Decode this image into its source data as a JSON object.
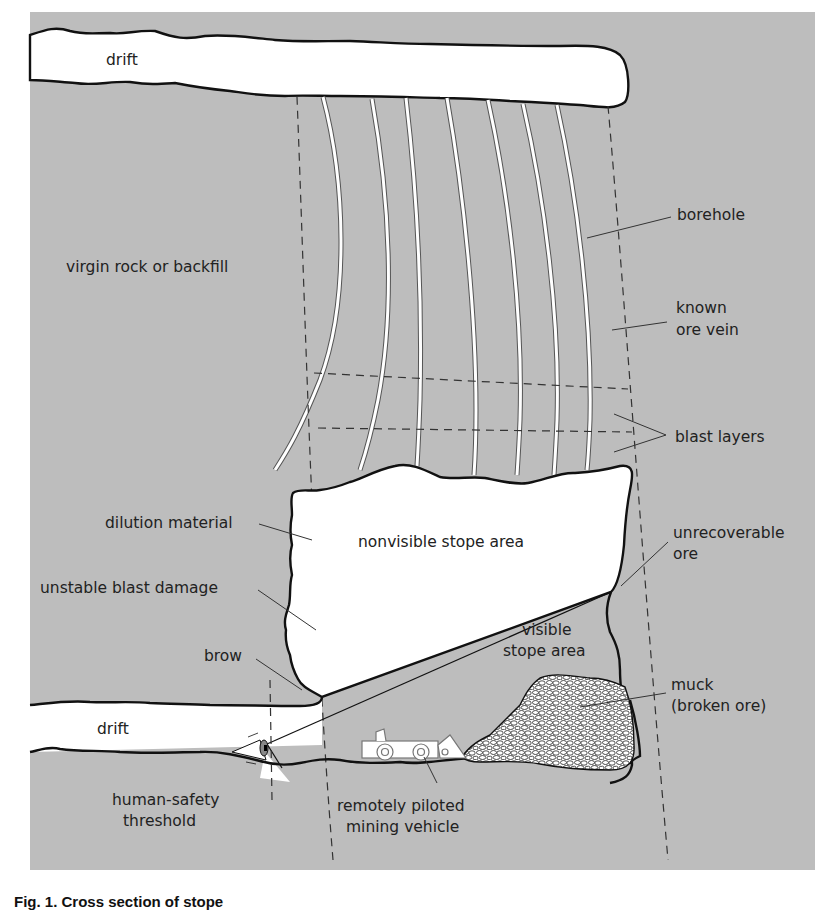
{
  "figure": {
    "caption": "Fig. 1. Cross section of stope",
    "colors": {
      "rock": "#bdbdbd",
      "void": "#ffffff",
      "outline": "#111111",
      "text": "#222222",
      "leader": "#333333"
    }
  },
  "labels": {
    "drift_top": "drift",
    "virgin_rock": "virgin rock or backfill",
    "borehole": "borehole",
    "known_ore_vein_1": "known",
    "known_ore_vein_2": "ore vein",
    "blast_layers": "blast layers",
    "dilution_material": "dilution material",
    "nonvisible_stope_area": "nonvisible stope area",
    "unrecoverable_ore_1": "unrecoverable",
    "unrecoverable_ore_2": "ore",
    "unstable_blast_damage": "unstable blast damage",
    "visible_stope_area_1": "visible",
    "visible_stope_area_2": "stope area",
    "brow": "brow",
    "muck_1": "muck",
    "muck_2": "(broken ore)",
    "drift_bottom": "drift",
    "human_safety_threshold_1": "human-safety",
    "human_safety_threshold_2": "threshold",
    "remote_vehicle_1": "remotely piloted",
    "remote_vehicle_2": "mining vehicle"
  }
}
